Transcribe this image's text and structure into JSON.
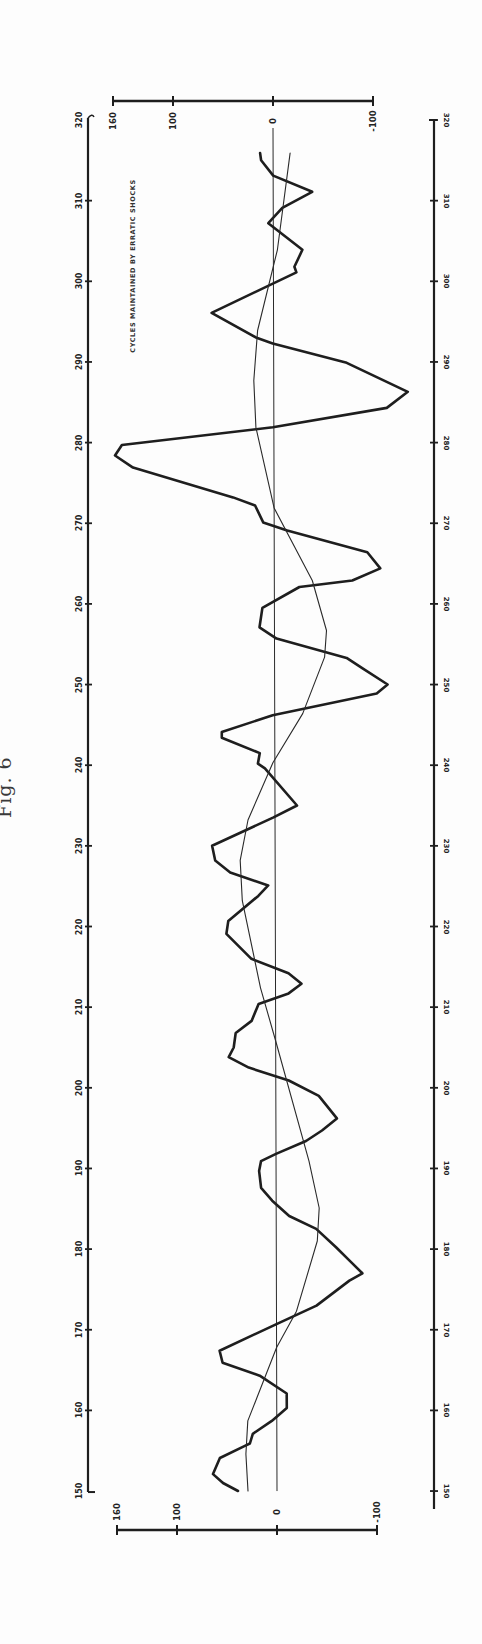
{
  "figure": {
    "caption": "Fig. 6",
    "annotation": "CYCLES MAINTAINED BY ERRATIC SHOCKS"
  },
  "colors": {
    "ink": "#1e1e1e",
    "thin_ink": "#2a2a2a",
    "paper": "#fdfdfd"
  },
  "chart_data": {
    "type": "line",
    "title": "Fig. 6",
    "annotation": "CYCLES MAINTAINED BY ERRATIC SHOCKS",
    "orientation": "rotated 90° (time axis runs vertically, bottom = 150, top = 320)",
    "xlabel": "",
    "ylabel": "",
    "xlim": [
      150,
      320
    ],
    "ylim": [
      -100,
      160
    ],
    "x_ticks": [
      150,
      160,
      170,
      180,
      190,
      200,
      210,
      220,
      230,
      240,
      250,
      260,
      270,
      280,
      290,
      300,
      310,
      320
    ],
    "x_tick_labels": [
      "150",
      "160",
      "170",
      "180",
      "190",
      "200",
      "210",
      "220",
      "230",
      "240",
      "250",
      "260",
      "270",
      "280",
      "290",
      "300",
      "310",
      "320"
    ],
    "y_ticks": [
      160,
      100,
      0,
      -100
    ],
    "y_tick_labels": [
      "160",
      "100",
      "0",
      "-100"
    ],
    "grid": false,
    "zero_line": true,
    "legend": null,
    "series": [
      {
        "name": "erratic-shock cycle (heavy line)",
        "style": "thick",
        "points": [
          [
            150.0,
            39
          ],
          [
            151.0,
            54
          ],
          [
            152.1,
            64
          ],
          [
            154.1,
            57
          ],
          [
            155.6,
            32
          ],
          [
            155.9,
            27
          ],
          [
            157.1,
            24
          ],
          [
            158.7,
            5
          ],
          [
            160.3,
            -10
          ],
          [
            162.1,
            -10
          ],
          [
            164.3,
            17
          ],
          [
            165.9,
            54
          ],
          [
            167.4,
            57
          ],
          [
            170.7,
            0
          ],
          [
            173.0,
            -40
          ],
          [
            176.1,
            -73
          ],
          [
            177.0,
            -86
          ],
          [
            178.6,
            -73
          ],
          [
            180.2,
            -60
          ],
          [
            182.5,
            -40
          ],
          [
            184.1,
            -13
          ],
          [
            186.0,
            4
          ],
          [
            187.6,
            15
          ],
          [
            189.7,
            17
          ],
          [
            190.9,
            15
          ],
          [
            191.8,
            0
          ],
          [
            193.4,
            -30
          ],
          [
            194.7,
            -46
          ],
          [
            196.2,
            -61
          ],
          [
            199.0,
            -43
          ],
          [
            200.9,
            -13
          ],
          [
            202.5,
            27
          ],
          [
            203.8,
            47
          ],
          [
            205.0,
            42
          ],
          [
            206.8,
            40
          ],
          [
            208.3,
            24
          ],
          [
            210.4,
            17
          ],
          [
            211.7,
            -13
          ],
          [
            212.9,
            -26
          ],
          [
            214.2,
            -13
          ],
          [
            216.0,
            24
          ],
          [
            219.1,
            49
          ],
          [
            220.7,
            47
          ],
          [
            223.8,
            17
          ],
          [
            225.1,
            7
          ],
          [
            226.7,
            45
          ],
          [
            228.2,
            60
          ],
          [
            230.0,
            63
          ],
          [
            233.5,
            2
          ],
          [
            235.0,
            -22
          ],
          [
            239.6,
            10
          ],
          [
            240.2,
            17
          ],
          [
            241.5,
            15
          ],
          [
            243.4,
            53
          ],
          [
            244.1,
            53
          ],
          [
            246.2,
            2
          ],
          [
            248.9,
            -102
          ],
          [
            250.0,
            -113
          ],
          [
            252.0,
            -88
          ],
          [
            253.3,
            -72
          ],
          [
            255.7,
            -2
          ],
          [
            257.1,
            15
          ],
          [
            259.5,
            12
          ],
          [
            262.1,
            -25
          ],
          [
            262.9,
            -78
          ],
          [
            264.4,
            -106
          ],
          [
            266.4,
            -93
          ],
          [
            269.1,
            -13
          ],
          [
            270.1,
            11
          ],
          [
            272.2,
            19
          ],
          [
            273.2,
            41
          ],
          [
            276.9,
            141
          ],
          [
            278.4,
            159
          ],
          [
            279.7,
            152
          ],
          [
            281.9,
            1
          ],
          [
            284.3,
            -113
          ],
          [
            286.3,
            -134
          ],
          [
            289.9,
            -73
          ],
          [
            292.3,
            1
          ],
          [
            293.0,
            17
          ],
          [
            296.1,
            62
          ],
          [
            301.1,
            -23
          ],
          [
            301.8,
            -21
          ],
          [
            303.9,
            -29
          ],
          [
            307.2,
            5
          ],
          [
            309.1,
            -9
          ],
          [
            311.1,
            -39
          ],
          [
            313.1,
            0
          ],
          [
            315.0,
            12
          ],
          [
            315.9,
            13
          ]
        ]
      },
      {
        "name": "underlying smooth cycle (thin line)",
        "style": "thin",
        "points": [
          [
            150.0,
            29
          ],
          [
            154.6,
            31
          ],
          [
            158.7,
            29
          ],
          [
            161.5,
            20
          ],
          [
            167.8,
            0
          ],
          [
            172.3,
            -20
          ],
          [
            181.0,
            -41
          ],
          [
            185.1,
            -43
          ],
          [
            190.9,
            -33
          ],
          [
            205.8,
            0
          ],
          [
            212.4,
            15
          ],
          [
            223.2,
            33
          ],
          [
            228.2,
            35
          ],
          [
            233.2,
            27
          ],
          [
            240.3,
            2
          ],
          [
            246.4,
            -28
          ],
          [
            253.4,
            -50
          ],
          [
            256.7,
            -52
          ],
          [
            262.9,
            -38
          ],
          [
            271.9,
            0
          ],
          [
            281.9,
            18
          ],
          [
            287.7,
            20
          ],
          [
            293.9,
            16
          ],
          [
            303.9,
            -4
          ],
          [
            315.9,
            -17
          ]
        ]
      }
    ]
  }
}
